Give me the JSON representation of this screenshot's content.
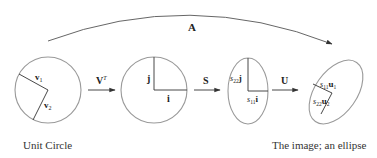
{
  "diagram": {
    "title_arrow": {
      "label": "A"
    },
    "stages": [
      {
        "name": "unit-circle",
        "shape": "circle",
        "vectors": [
          {
            "label_main": "v",
            "label_sub": "1"
          },
          {
            "label_main": "v",
            "label_sub": "2"
          }
        ],
        "caption": "Unit Circle"
      },
      {
        "name": "rotated-circle",
        "shape": "circle",
        "vectors": [
          {
            "label_main": "j",
            "label_sub": ""
          },
          {
            "label_main": "i",
            "label_sub": ""
          }
        ]
      },
      {
        "name": "scaled-ellipse",
        "shape": "ellipse",
        "vectors": [
          {
            "label_coef": "s",
            "label_coef_sub": "22",
            "label_main": "j"
          },
          {
            "label_coef": "s",
            "label_coef_sub": "11",
            "label_main": "i"
          }
        ]
      },
      {
        "name": "rotated-ellipse",
        "shape": "ellipse",
        "vectors": [
          {
            "label_coef": "s",
            "label_coef_sub": "11",
            "label_main": "u",
            "label_sub": "1"
          },
          {
            "label_coef": "s",
            "label_coef_sub": "22",
            "label_main": "u",
            "label_sub": "2"
          }
        ],
        "caption": "The image; an ellipse"
      }
    ],
    "transforms": [
      {
        "label_main": "V",
        "label_sup": "T"
      },
      {
        "label_main": "S"
      },
      {
        "label_main": "U"
      }
    ],
    "colors": {
      "shape_stroke": "#9a9a9a",
      "line_stroke": "#333333",
      "text": "#222222"
    }
  }
}
